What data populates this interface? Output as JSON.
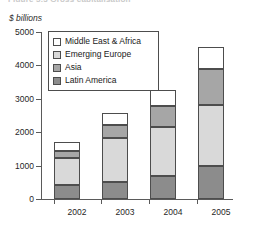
{
  "figure": {
    "caption": "Figure 5.3  Gross capitalisation",
    "unit_label": "$ billions"
  },
  "chart_data": {
    "type": "bar",
    "stacked": true,
    "title": "",
    "subtitle": "",
    "xlabel": "",
    "ylabel": "$ billions",
    "categories": [
      "2002",
      "2003",
      "2004",
      "2005"
    ],
    "ylim": [
      0,
      5000
    ],
    "yticks": [
      0,
      1000,
      2000,
      3000,
      4000,
      5000
    ],
    "ytick_labels": [
      "0",
      "1000",
      "2000",
      "3000",
      "4000",
      "5000"
    ],
    "grid": false,
    "legend_position": "upper-left-inside",
    "series": [
      {
        "name": "Latin America",
        "color": "#8c8c8c",
        "values": [
          420,
          510,
          690,
          1000
        ]
      },
      {
        "name": "Emerging Europe",
        "color": "#d9d9d9",
        "values": [
          810,
          1330,
          1480,
          1810
        ]
      },
      {
        "name": "Asia",
        "color": "#a6a6a6",
        "values": [
          210,
          390,
          600,
          1080
        ]
      },
      {
        "name": "Middle East & Africa",
        "color": "#ffffff",
        "values": [
          270,
          330,
          480,
          660
        ]
      }
    ],
    "totals": [
      1710,
      2560,
      3250,
      4550
    ],
    "legend_order": [
      "Middle East & Africa",
      "Emerging Europe",
      "Asia",
      "Latin America"
    ],
    "stack_order_bottom_to_top": [
      "Latin America",
      "Emerging Europe",
      "Asia",
      "Middle East & Africa"
    ]
  },
  "colors": {
    "middle_east_africa": "#ffffff",
    "emerging_europe": "#d9d9d9",
    "asia": "#a6a6a6",
    "latin_america": "#8c8c8c",
    "axis": "#5a5a5a",
    "outline": "#4d4d4d",
    "background": "#ffffff"
  }
}
